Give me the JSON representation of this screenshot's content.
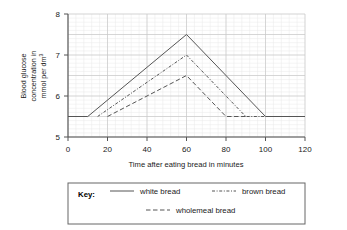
{
  "chart_data": {
    "type": "line",
    "title": "",
    "xlabel": "Time after eating bread in minutes",
    "ylabel": "Blood glucose concentration in mmol per dm",
    "ylabel_sup": "3",
    "ylabel_line1": "Blood glucose",
    "ylabel_line2": "concentration in",
    "ylabel_line3": "mmol per dm",
    "xlim": [
      0,
      120
    ],
    "ylim": [
      5,
      8
    ],
    "xticks": [
      0,
      20,
      40,
      60,
      80,
      100,
      120
    ],
    "yticks": [
      5,
      6,
      7,
      8
    ],
    "grid": true,
    "grid_minor": true,
    "baseline": 5.5,
    "legend_position": "below",
    "series": [
      {
        "name": "white bread",
        "style": "solid",
        "color": "#555555",
        "points": [
          {
            "x": 0,
            "y": 5.5
          },
          {
            "x": 10,
            "y": 5.5
          },
          {
            "x": 60,
            "y": 7.5
          },
          {
            "x": 100,
            "y": 5.5
          },
          {
            "x": 120,
            "y": 5.5
          }
        ]
      },
      {
        "name": "brown bread",
        "style": "dash-dot",
        "color": "#555555",
        "points": [
          {
            "x": 15,
            "y": 5.5
          },
          {
            "x": 60,
            "y": 7.0
          },
          {
            "x": 90,
            "y": 5.5
          },
          {
            "x": 100,
            "y": 5.5
          }
        ]
      },
      {
        "name": "wholemeal bread",
        "style": "dashed",
        "color": "#555555",
        "points": [
          {
            "x": 20,
            "y": 5.5
          },
          {
            "x": 60,
            "y": 6.5
          },
          {
            "x": 80,
            "y": 5.5
          },
          {
            "x": 90,
            "y": 5.5
          }
        ]
      }
    ]
  },
  "legend": {
    "key_label": "Key:",
    "entries": [
      {
        "label": "white bread",
        "style": "solid"
      },
      {
        "label": "brown bread",
        "style": "dash-dot"
      },
      {
        "label": "wholemeal bread",
        "style": "dashed"
      }
    ]
  },
  "axis": {
    "x_tick_labels": [
      "0",
      "20",
      "40",
      "60",
      "80",
      "100",
      "120"
    ],
    "y_tick_labels": [
      "5",
      "6",
      "7",
      "8"
    ]
  },
  "colors": {
    "line": "#555555",
    "axis": "#555555",
    "grid_major": "#c9c9c9",
    "grid_minor": "#e8e8e8",
    "legend_border": "#666666",
    "text": "#1a1a1a"
  }
}
